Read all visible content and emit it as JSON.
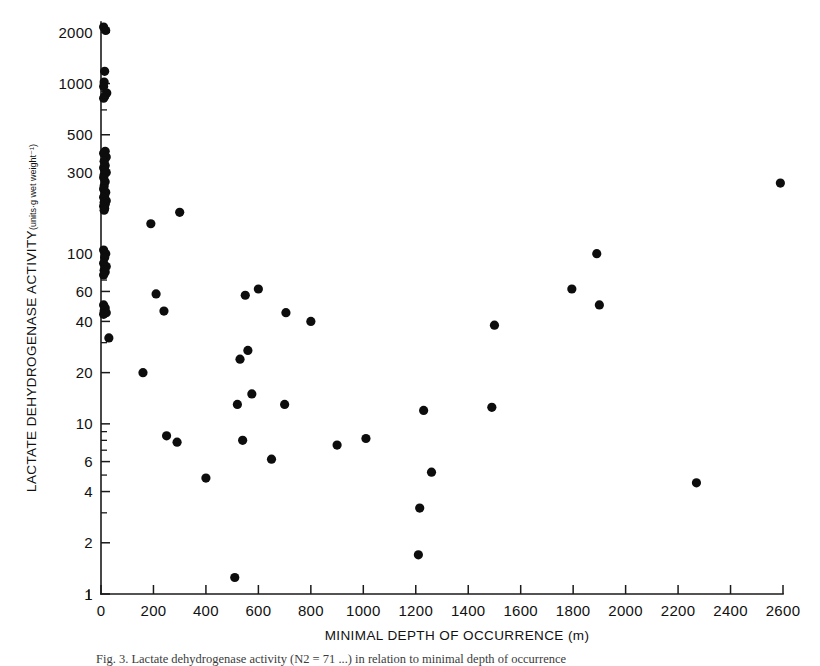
{
  "figure": {
    "caption": "Fig. 3.  Lactate dehydrogenase activity (N2 = 71 ...) in relation to minimal depth of occurrence",
    "background_color": "#ffffff",
    "point_color": "#0d0d0d",
    "axis_color": "#1a1a1a"
  },
  "chart_data": {
    "type": "scatter",
    "title": "",
    "xlabel": "MINIMAL DEPTH OF OCCURRENCE (m)",
    "ylabel": "LACTATE DEHYDROGENASE ACTIVITY",
    "ylabel_units": "(units·g wet weight⁻¹)",
    "xscale": "linear",
    "yscale": "log",
    "xlim": [
      0,
      2600
    ],
    "ylim": [
      1,
      2300
    ],
    "grid": false,
    "legend": null,
    "xticks": [
      0,
      200,
      400,
      600,
      800,
      1000,
      1200,
      1400,
      1600,
      1800,
      2000,
      2200,
      2400,
      2600
    ],
    "xtick_labels": [
      "0",
      "200",
      "400",
      "600",
      "800",
      "1000",
      "1200",
      "1400",
      "1600",
      "1800",
      "2000",
      "2200",
      "2400",
      "2600"
    ],
    "yticks": [
      1,
      2,
      4,
      6,
      10,
      20,
      40,
      60,
      100,
      300,
      500,
      1000,
      2000
    ],
    "ytick_labels": [
      "1",
      "2",
      "4",
      "6",
      "10",
      "20",
      "40",
      "60",
      "100",
      "300",
      "500",
      "1000",
      "2000"
    ],
    "y_minor_ticks": [
      3,
      5,
      7,
      8,
      9,
      30,
      50,
      70,
      80,
      90,
      200,
      400,
      700,
      800,
      900
    ],
    "points": [
      {
        "x": 10,
        "y": 2150
      },
      {
        "x": 18,
        "y": 2050
      },
      {
        "x": 14,
        "y": 1180
      },
      {
        "x": 12,
        "y": 1020
      },
      {
        "x": 10,
        "y": 960
      },
      {
        "x": 22,
        "y": 880
      },
      {
        "x": 14,
        "y": 840
      },
      {
        "x": 10,
        "y": 820
      },
      {
        "x": 16,
        "y": 400
      },
      {
        "x": 10,
        "y": 390
      },
      {
        "x": 20,
        "y": 370
      },
      {
        "x": 12,
        "y": 350
      },
      {
        "x": 16,
        "y": 330
      },
      {
        "x": 10,
        "y": 320
      },
      {
        "x": 14,
        "y": 310
      },
      {
        "x": 20,
        "y": 300
      },
      {
        "x": 12,
        "y": 290
      },
      {
        "x": 10,
        "y": 280
      },
      {
        "x": 16,
        "y": 265
      },
      {
        "x": 12,
        "y": 250
      },
      {
        "x": 10,
        "y": 240
      },
      {
        "x": 18,
        "y": 230
      },
      {
        "x": 14,
        "y": 220
      },
      {
        "x": 10,
        "y": 215
      },
      {
        "x": 20,
        "y": 205
      },
      {
        "x": 12,
        "y": 200
      },
      {
        "x": 16,
        "y": 195
      },
      {
        "x": 10,
        "y": 190
      },
      {
        "x": 14,
        "y": 185
      },
      {
        "x": 12,
        "y": 180
      },
      {
        "x": 10,
        "y": 105
      },
      {
        "x": 18,
        "y": 100
      },
      {
        "x": 14,
        "y": 95
      },
      {
        "x": 10,
        "y": 88
      },
      {
        "x": 20,
        "y": 84
      },
      {
        "x": 12,
        "y": 80
      },
      {
        "x": 16,
        "y": 78
      },
      {
        "x": 10,
        "y": 75
      },
      {
        "x": 10,
        "y": 50
      },
      {
        "x": 16,
        "y": 48
      },
      {
        "x": 12,
        "y": 46
      },
      {
        "x": 20,
        "y": 45
      },
      {
        "x": 10,
        "y": 44
      },
      {
        "x": 30,
        "y": 32
      },
      {
        "x": 160,
        "y": 20
      },
      {
        "x": 190,
        "y": 150
      },
      {
        "x": 300,
        "y": 175
      },
      {
        "x": 210,
        "y": 58
      },
      {
        "x": 240,
        "y": 46
      },
      {
        "x": 250,
        "y": 8.5
      },
      {
        "x": 290,
        "y": 7.8
      },
      {
        "x": 400,
        "y": 4.8
      },
      {
        "x": 510,
        "y": 1.25
      },
      {
        "x": 520,
        "y": 13
      },
      {
        "x": 530,
        "y": 24
      },
      {
        "x": 540,
        "y": 8
      },
      {
        "x": 550,
        "y": 57
      },
      {
        "x": 560,
        "y": 27
      },
      {
        "x": 575,
        "y": 15
      },
      {
        "x": 600,
        "y": 62
      },
      {
        "x": 650,
        "y": 6.2
      },
      {
        "x": 700,
        "y": 13
      },
      {
        "x": 705,
        "y": 45
      },
      {
        "x": 800,
        "y": 40
      },
      {
        "x": 900,
        "y": 7.5
      },
      {
        "x": 1010,
        "y": 8.2
      },
      {
        "x": 1210,
        "y": 1.7
      },
      {
        "x": 1215,
        "y": 3.2
      },
      {
        "x": 1230,
        "y": 12
      },
      {
        "x": 1260,
        "y": 5.2
      },
      {
        "x": 1490,
        "y": 12.5
      },
      {
        "x": 1500,
        "y": 38
      },
      {
        "x": 1795,
        "y": 62
      },
      {
        "x": 1890,
        "y": 100
      },
      {
        "x": 1900,
        "y": 50
      },
      {
        "x": 2270,
        "y": 4.5
      },
      {
        "x": 2590,
        "y": 260
      }
    ]
  }
}
